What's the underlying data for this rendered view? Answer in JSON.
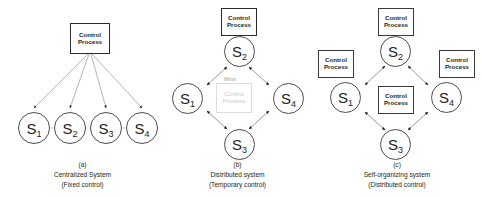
{
  "figure": {
    "panels": [
      {
        "id": "a",
        "layout": "centralized",
        "caption": {
          "tag": "(a)",
          "line1": "Centralized System",
          "line2": "(Fixed control)"
        },
        "control_boxes": [
          {
            "name": "central-control-process",
            "line1": "Control",
            "line2": "Process"
          }
        ],
        "nodes": [
          {
            "id": "S1",
            "letter": "S",
            "index": "1"
          },
          {
            "id": "S2",
            "letter": "S",
            "index": "2"
          },
          {
            "id": "S3",
            "letter": "S",
            "index": "3"
          },
          {
            "id": "S4",
            "letter": "S",
            "index": "4"
          }
        ]
      },
      {
        "id": "b",
        "layout": "distributed-diamond",
        "caption": {
          "tag": "(b)",
          "line1": "Distributed system",
          "line2": "(Temporary control)"
        },
        "control_boxes": [
          {
            "name": "s2-control-process",
            "line1": "Control",
            "line2": "Process"
          }
        ],
        "mirror": {
          "label": "Mirror",
          "line1": "Control",
          "line2": "Process"
        },
        "nodes": [
          {
            "id": "S1",
            "letter": "S",
            "index": "1"
          },
          {
            "id": "S2",
            "letter": "S",
            "index": "2"
          },
          {
            "id": "S3",
            "letter": "S",
            "index": "3"
          },
          {
            "id": "S4",
            "letter": "S",
            "index": "4"
          }
        ]
      },
      {
        "id": "c",
        "layout": "self-organizing-diamond",
        "caption": {
          "tag": "(c)",
          "line1": "Self-organizing system",
          "line2": "(Distributed control)"
        },
        "control_boxes": [
          {
            "name": "s2-control-process",
            "line1": "Control",
            "line2": "Process"
          },
          {
            "name": "s1-control-process",
            "line1": "Control",
            "line2": "Process"
          },
          {
            "name": "s4-control-process",
            "line1": "Control",
            "line2": "Process"
          },
          {
            "name": "s3-control-process",
            "line1": "Control",
            "line2": "Process"
          }
        ],
        "nodes": [
          {
            "id": "S1",
            "letter": "S",
            "index": "1"
          },
          {
            "id": "S2",
            "letter": "S",
            "index": "2"
          },
          {
            "id": "S3",
            "letter": "S",
            "index": "3"
          },
          {
            "id": "S4",
            "letter": "S",
            "index": "4"
          }
        ]
      }
    ],
    "colors": {
      "stroke": "#4d4d4d",
      "box_stroke": "#2b2b2b",
      "text": "#231f20",
      "ghost": "#c9c9c9",
      "background": "#ffffff"
    }
  }
}
